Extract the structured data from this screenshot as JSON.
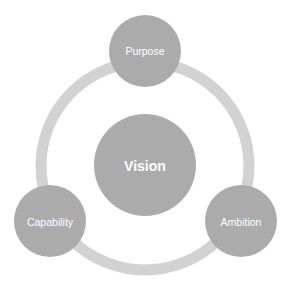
{
  "diagram": {
    "ring": {
      "cx": 145,
      "cy": 166,
      "r": 104,
      "stroke_width": 11,
      "color": "#d2d2d2"
    },
    "center": {
      "label": "Vision",
      "cx": 145,
      "cy": 165,
      "r": 51,
      "color": "#ababab"
    },
    "nodes": [
      {
        "label": "Purpose",
        "cx": 145,
        "cy": 51,
        "r": 36,
        "color": "#ababab"
      },
      {
        "label": "Capability",
        "cx": 50,
        "cy": 221,
        "r": 36,
        "color": "#ababab"
      },
      {
        "label": "Ambition",
        "cx": 241,
        "cy": 221,
        "r": 36,
        "color": "#ababab"
      }
    ]
  }
}
